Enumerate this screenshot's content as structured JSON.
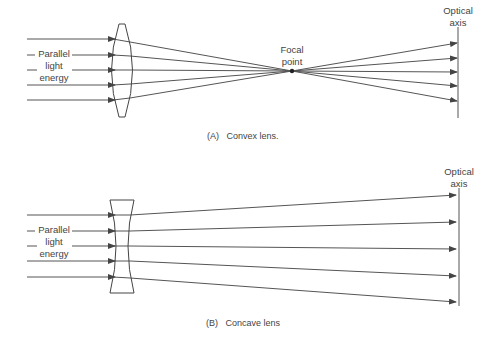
{
  "diagram_a": {
    "left_label": [
      "Parallel",
      "light",
      "energy"
    ],
    "focal_label": [
      "Focal",
      "point"
    ],
    "axis_label": [
      "Optical",
      "axis"
    ],
    "caption": "(A)   Convex lens."
  },
  "diagram_b": {
    "left_label": [
      "Parallel",
      "light",
      "energy"
    ],
    "axis_label": [
      "Optical",
      "axis"
    ],
    "caption": "(B)   Concave lens"
  },
  "colors": {
    "line": "#555555",
    "background": "#ffffff"
  }
}
